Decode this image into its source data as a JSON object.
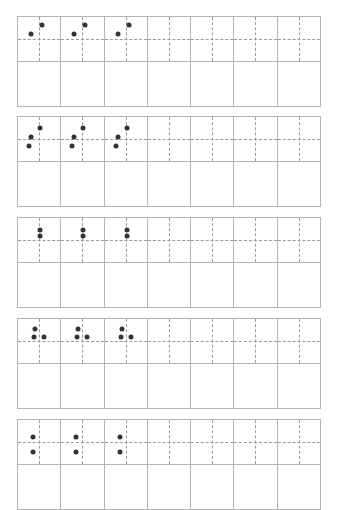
{
  "worksheet": {
    "columns": 7,
    "blocks": [
      {
        "top": 16,
        "dots": [
          [
            13,
            17
          ],
          [
            24,
            8
          ]
        ]
      },
      {
        "top": 116,
        "dots": [
          [
            22,
            11
          ],
          [
            13,
            20
          ],
          [
            11,
            29
          ]
        ]
      },
      {
        "top": 217,
        "dots": [
          [
            22,
            12
          ],
          [
            22,
            18
          ]
        ]
      },
      {
        "top": 318,
        "dots": [
          [
            17,
            10
          ],
          [
            16,
            18
          ],
          [
            26,
            18
          ]
        ]
      },
      {
        "top": 419,
        "dots": [
          [
            15,
            17
          ],
          [
            15,
            32
          ]
        ]
      }
    ],
    "dotted_columns": [
      0,
      1,
      2
    ],
    "colors": {
      "dot": "#333333",
      "border": "#b5b5b5",
      "guide": "#9a9a9a"
    }
  }
}
